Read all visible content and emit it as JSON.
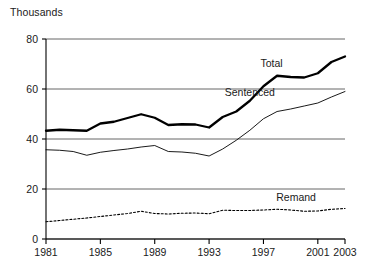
{
  "chart_data": {
    "type": "line",
    "title": "",
    "unit_label": "Thousands",
    "xlabel": "",
    "ylabel": "",
    "xlim": [
      1981,
      2003
    ],
    "ylim": [
      0,
      80
    ],
    "ytick_values": [
      0,
      20,
      40,
      60,
      80
    ],
    "ytick_labels": [
      "0",
      "20",
      "40",
      "60",
      "80"
    ],
    "xtick_values": [
      1981,
      1985,
      1989,
      1993,
      1997,
      2001,
      2003
    ],
    "xtick_labels": [
      "1981",
      "1985",
      "1989",
      "1993",
      "1997",
      "2001",
      "2003"
    ],
    "grid": "horizontal",
    "legend_position": "inline-annotations",
    "x": [
      1981,
      1982,
      1983,
      1984,
      1985,
      1986,
      1987,
      1988,
      1989,
      1990,
      1991,
      1992,
      1993,
      1994,
      1995,
      1996,
      1997,
      1998,
      1999,
      2000,
      2001,
      2002,
      2003
    ],
    "series": [
      {
        "name": "Total",
        "style": "thick-solid",
        "color": "#000000",
        "label_x": 1997.6,
        "label_y": 70.5,
        "values": [
          43.3,
          43.7,
          43.5,
          43.3,
          46.2,
          46.9,
          48.4,
          49.9,
          48.5,
          45.6,
          45.9,
          45.8,
          44.6,
          48.8,
          51.0,
          55.3,
          61.1,
          65.3,
          64.8,
          64.6,
          66.3,
          70.8,
          73.0
        ]
      },
      {
        "name": "Sentenced",
        "style": "thin-solid",
        "color": "#000000",
        "label_x": 1996.0,
        "label_y": 59.0,
        "values": [
          35.7,
          35.5,
          35.0,
          33.5,
          34.7,
          35.4,
          36.0,
          36.8,
          37.4,
          35.0,
          34.8,
          34.3,
          33.2,
          36.0,
          39.5,
          43.5,
          48.1,
          51.0,
          52.0,
          53.2,
          54.4,
          56.8,
          59.0
        ]
      },
      {
        "name": "Remand",
        "style": "dotted",
        "color": "#000000",
        "label_x": 1999.4,
        "label_y": 17.0,
        "values": [
          6.9,
          7.4,
          7.9,
          8.4,
          9.0,
          9.6,
          10.2,
          11.1,
          10.2,
          10.0,
          10.3,
          10.4,
          10.1,
          11.5,
          11.4,
          11.4,
          11.6,
          11.9,
          11.6,
          11.1,
          11.2,
          11.9,
          12.2
        ]
      }
    ]
  }
}
